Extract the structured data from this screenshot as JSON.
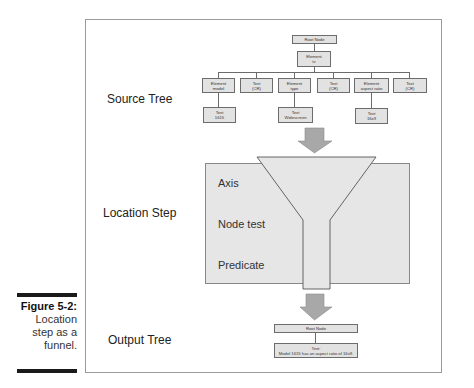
{
  "figure": {
    "label": "Figure 5-2:",
    "caption_lines": [
      "Location",
      "step as a",
      "funnel."
    ]
  },
  "sections": {
    "source_tree": "Source Tree",
    "location_step": "Location Step",
    "output_tree": "Output Tree"
  },
  "source_tree": {
    "root": "Root Node",
    "element": {
      "line1": "Element",
      "line2": "tv"
    },
    "children": [
      {
        "line1": "Element",
        "line2": "model"
      },
      {
        "line1": "Text",
        "line2": "(CR)"
      },
      {
        "line1": "Element",
        "line2": "type"
      },
      {
        "line1": "Text",
        "line2": "(CR)"
      },
      {
        "line1": "Element",
        "line2": "aspect ratio"
      },
      {
        "line1": "Text",
        "line2": "(CR)"
      }
    ],
    "grandchildren": [
      {
        "line1": "Text",
        "line2": "1615"
      },
      {
        "line1": "Text",
        "line2": "Widescreen"
      },
      {
        "line1": "Text",
        "line2": "16x9"
      }
    ]
  },
  "location_step": {
    "axis": "Axis",
    "node_test": "Node test",
    "predicate": "Predicate"
  },
  "output_tree": {
    "root": "Root Node",
    "text": {
      "line1": "Text:",
      "line2": "Model 1615 has an aspect ratio of 16x9."
    }
  },
  "colors": {
    "node_fill": "#e2e2e2",
    "box_fill": "#e6e6e6",
    "arrow_fill": "#a8a8a8",
    "frame": "#9a9a9a"
  }
}
